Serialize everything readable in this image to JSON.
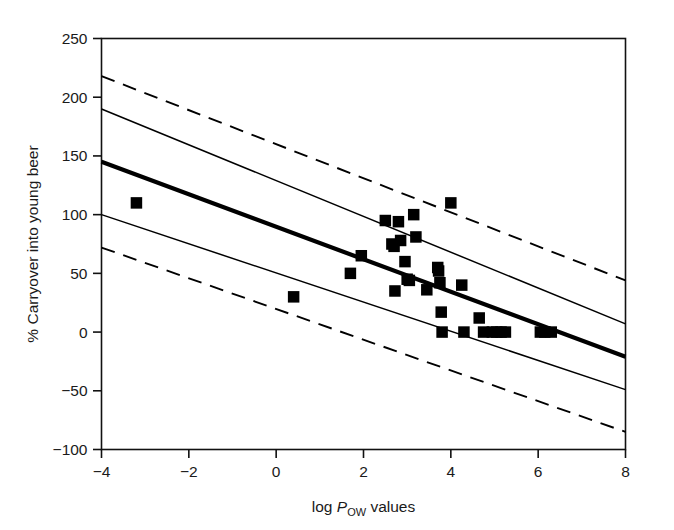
{
  "chart_data": {
    "type": "scatter",
    "title": "",
    "subtitle": "",
    "xlabel_parts": {
      "pre": "log ",
      "italic": "P",
      "subscript": "OW",
      "post": " values"
    },
    "xlabel": "log POW values",
    "ylabel": "% Carryover into young beer",
    "xlim": [
      -4,
      8
    ],
    "ylim": [
      -100,
      250
    ],
    "xticks": [
      -4,
      -2,
      0,
      2,
      4,
      6,
      8
    ],
    "xtick_labels": [
      "−4",
      "−2",
      "0",
      "2",
      "4",
      "6",
      "8"
    ],
    "yticks": [
      -100,
      -50,
      0,
      50,
      100,
      150,
      200,
      250
    ],
    "ytick_labels": [
      "−100",
      "−50",
      "0",
      "50",
      "100",
      "150",
      "200",
      "250"
    ],
    "grid": false,
    "legend": null,
    "marker_style": "filled-square",
    "marker_color": "#000000",
    "points": [
      {
        "x": -3.2,
        "y": 110
      },
      {
        "x": 0.4,
        "y": 30
      },
      {
        "x": 1.7,
        "y": 50
      },
      {
        "x": 1.95,
        "y": 65
      },
      {
        "x": 2.5,
        "y": 95
      },
      {
        "x": 2.65,
        "y": 75
      },
      {
        "x": 2.7,
        "y": 73
      },
      {
        "x": 2.72,
        "y": 35
      },
      {
        "x": 2.8,
        "y": 94
      },
      {
        "x": 2.85,
        "y": 78
      },
      {
        "x": 2.95,
        "y": 60
      },
      {
        "x": 3.0,
        "y": 45
      },
      {
        "x": 3.05,
        "y": 44
      },
      {
        "x": 3.15,
        "y": 100
      },
      {
        "x": 3.2,
        "y": 81
      },
      {
        "x": 3.45,
        "y": 36
      },
      {
        "x": 3.7,
        "y": 55
      },
      {
        "x": 3.72,
        "y": 52
      },
      {
        "x": 3.75,
        "y": 42
      },
      {
        "x": 3.78,
        "y": 17
      },
      {
        "x": 3.8,
        "y": 0
      },
      {
        "x": 4.0,
        "y": 110
      },
      {
        "x": 4.25,
        "y": 40
      },
      {
        "x": 4.3,
        "y": 0
      },
      {
        "x": 4.65,
        "y": 12
      },
      {
        "x": 4.75,
        "y": 0
      },
      {
        "x": 4.95,
        "y": 0
      },
      {
        "x": 5.05,
        "y": 0
      },
      {
        "x": 5.15,
        "y": 0
      },
      {
        "x": 5.25,
        "y": 0
      },
      {
        "x": 6.05,
        "y": 0
      },
      {
        "x": 6.15,
        "y": 0
      },
      {
        "x": 6.3,
        "y": 0
      }
    ],
    "lines": [
      {
        "name": "regression-line",
        "style": "solid-thick",
        "x0": -4,
        "y0": 145,
        "x1": 8,
        "y1": -21
      },
      {
        "name": "confidence-upper",
        "style": "solid-thin",
        "x0": -4,
        "y0": 190,
        "x1": 8,
        "y1": 7
      },
      {
        "name": "confidence-lower",
        "style": "solid-thin",
        "x0": -4,
        "y0": 100,
        "x1": 8,
        "y1": -49
      },
      {
        "name": "prediction-upper",
        "style": "dashed",
        "x0": -4,
        "y0": 218,
        "x1": 8,
        "y1": 44
      },
      {
        "name": "prediction-lower",
        "style": "dashed",
        "x0": -4,
        "y0": 72,
        "x1": 8,
        "y1": -85
      }
    ]
  }
}
